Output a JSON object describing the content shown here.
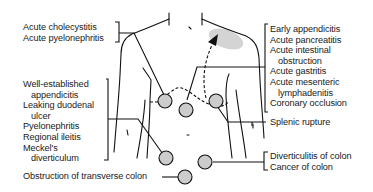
{
  "diagram": {
    "type": "anatomical-referred-pain-map",
    "left_labels": {
      "group1": [
        "Acute cholecystitis",
        "Acute pyelonephritis"
      ],
      "group2": [
        "Well-established",
        "appendicitis",
        "Leaking duodenal",
        "ulcer",
        "Pyelonephritis",
        "Regional ileitis",
        "Meckel's",
        "diverticulum"
      ],
      "group3": [
        "Obstruction of transverse colon"
      ]
    },
    "right_labels": {
      "group1": [
        "Early appendicitis",
        "Acute pancreatitis",
        "Acute intestinal",
        "obstruction",
        "Acute gastritis",
        "Acute mesenteric",
        "lymphadenitis",
        "Coronary occlusion"
      ],
      "group2": [
        "Splenic rupture"
      ],
      "group3": [
        "Diverticulitis of colon",
        "Cancer of colon"
      ]
    },
    "colors": {
      "line": "#111111",
      "circle_fill": "#cccccc",
      "shoulder_shade": "#d4d4d4",
      "background": "#ffffff"
    },
    "markers": {
      "circles": 7,
      "arrow": "dashed arrow to left shoulder region"
    }
  }
}
